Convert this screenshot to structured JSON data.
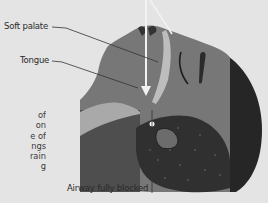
{
  "diagram": {
    "labels": {
      "soft_palate": "Soft palate",
      "tongue": "Tongue",
      "airway_blocked": "Airway fully blocked"
    },
    "body_text_fragments": [
      "of",
      "on",
      "e of",
      "ngs",
      "rain",
      "g"
    ],
    "colors": {
      "background": "#e4e4e4",
      "face": "#7a7a7a",
      "dark_region": "#4f4f4f",
      "hair": "#262626",
      "light_channel": "#b8b8b8",
      "airflow_arrow": "#f2f2f2",
      "leader_line": "#333333"
    },
    "icons": [
      "airflow-arrow-icon",
      "blockage-point-icon"
    ]
  }
}
